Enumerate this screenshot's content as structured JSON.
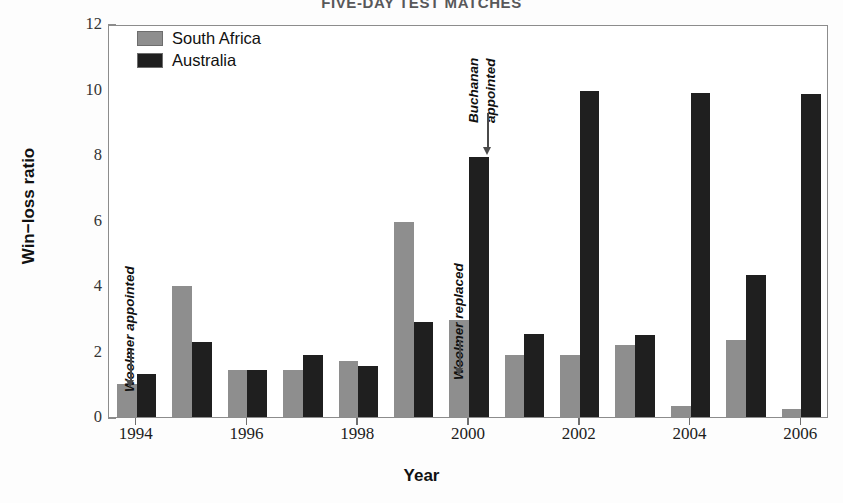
{
  "chart_data": {
    "type": "bar",
    "title": "FIVE-DAY TEST MATCHES",
    "xlabel": "Year",
    "ylabel": "Win−loss ratio",
    "ylim": [
      0,
      12
    ],
    "yticks": [
      0,
      2,
      4,
      6,
      8,
      10,
      12
    ],
    "ytick_labels": [
      "0",
      "2",
      "4",
      "6",
      "8",
      "10",
      "12"
    ],
    "grid": false,
    "legend_position": "top-left",
    "categories": [
      1994,
      1995,
      1996,
      1997,
      1998,
      1999,
      2000,
      2001,
      2002,
      2003,
      2004,
      2005,
      2006
    ],
    "xtick_labels": [
      "1994",
      "1996",
      "1998",
      "2000",
      "2002",
      "2004",
      "2006"
    ],
    "xticks": [
      1994,
      1996,
      1998,
      2000,
      2002,
      2004,
      2006
    ],
    "series": [
      {
        "name": "South Africa",
        "color": "#8e8e8e",
        "values": [
          1.0,
          4.0,
          1.45,
          1.45,
          1.7,
          5.95,
          2.95,
          1.9,
          1.9,
          2.2,
          0.35,
          2.35,
          0.25
        ]
      },
      {
        "name": "Australia",
        "color": "#1f1f1f",
        "values": [
          1.3,
          2.3,
          1.45,
          1.9,
          1.55,
          2.9,
          7.95,
          2.55,
          9.95,
          2.5,
          9.9,
          4.35,
          9.85
        ]
      }
    ],
    "annotations": [
      {
        "id": "woolmer-appointed",
        "text": "Woolmer appointed",
        "target_year": 1994,
        "target_series": "South Africa",
        "orientation": "vertical",
        "arrow": "down"
      },
      {
        "id": "woolmer-replaced",
        "text": "Woolmer replaced",
        "target_year": 2000,
        "target_series": "South Africa",
        "orientation": "vertical",
        "arrow": "down"
      },
      {
        "id": "buchanan-appointed",
        "text": "Buchanan appointed",
        "line1": "Buchanan",
        "line2": "appointed",
        "target_year": 2000,
        "target_series": "Australia",
        "orientation": "vertical",
        "arrow": "down"
      }
    ]
  },
  "legend": {
    "items": [
      {
        "label": "South Africa",
        "color": "#8e8e8e"
      },
      {
        "label": "Australia",
        "color": "#1f1f1f"
      }
    ]
  },
  "colors": {
    "south_africa": "#8e8e8e",
    "australia": "#1f1f1f",
    "axis": "#8c8c8c",
    "text": "#111111",
    "title": "#58585a"
  }
}
